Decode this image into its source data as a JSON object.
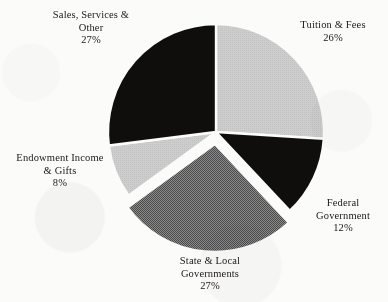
{
  "chart_data": {
    "type": "pie",
    "title": "",
    "subtitle": "",
    "xlabel": "",
    "ylabel": "",
    "legend_position": "none",
    "grid": false,
    "start_angle_deg": 0,
    "direction": "clockwise",
    "categories": [
      "Tuition & Fees",
      "Federal Government",
      "State & Local Governments",
      "Endowment Income & Gifts",
      "Sales, Services & Other"
    ],
    "values": [
      26,
      12,
      27,
      8,
      27
    ],
    "value_unit": "%",
    "slices": [
      {
        "name": "Tuition & Fees",
        "label_line1": "Tuition & Fees",
        "label_line2": "",
        "percent_text": "26%",
        "value": 26,
        "color": "#c9c9c9",
        "fill_style": "solid-light-gray",
        "exploded": false
      },
      {
        "name": "Federal Government",
        "label_line1": "Federal",
        "label_line2": "Government",
        "percent_text": "12%",
        "value": 12,
        "color": "#100e0d",
        "fill_style": "solid-black",
        "exploded": false
      },
      {
        "name": "State & Local Governments",
        "label_line1": "State & Local",
        "label_line2": "Governments",
        "percent_text": "27%",
        "value": 27,
        "color": "#6e6e6e",
        "fill_style": "dithered-mid-gray",
        "exploded": true
      },
      {
        "name": "Endowment Income & Gifts",
        "label_line1": "Endowment Income",
        "label_line2": "& Gifts",
        "percent_text": "8%",
        "value": 8,
        "color": "#c9c9c9",
        "fill_style": "solid-light-gray",
        "exploded": false
      },
      {
        "name": "Sales, Services & Other",
        "label_line1": "Sales, Services &",
        "label_line2": "Other",
        "percent_text": "27%",
        "value": 27,
        "color": "#100e0d",
        "fill_style": "solid-black",
        "exploded": false
      }
    ],
    "colors": {
      "light_gray": "#c9c9c9",
      "mid_gray": "#6e6e6e",
      "black": "#100e0d",
      "background": "#fbfbf9",
      "text": "#1b1917",
      "separator": "#fbfbf9"
    }
  }
}
